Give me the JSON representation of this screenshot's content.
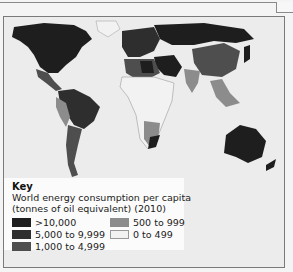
{
  "legend": {
    "title": "Key",
    "subtitle_line1": "World energy consumption per capita",
    "subtitle_line2": "(tonnes of oil equivalent) (2010)",
    "items": [
      {
        "label": ">10,000",
        "color": "#1e1e1e"
      },
      {
        "label": "5,000 to 9,999",
        "color": "#2e2e2e"
      },
      {
        "label": "1,000 to 4,999",
        "color": "#4e4e4e"
      },
      {
        "label": "500 to 999",
        "color": "#8c8c8c"
      },
      {
        "label": "0 to 499",
        "color": "#f2f2f2"
      }
    ]
  },
  "colors": {
    "ocean": "#ececec",
    "frame": "#7a7a7a",
    "legend_bg": "#fbfbfb"
  }
}
